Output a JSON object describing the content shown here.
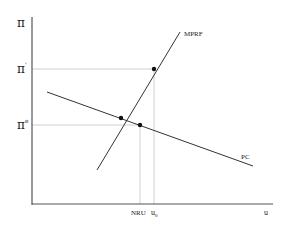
{
  "diagram": {
    "title": "",
    "axes": {
      "y_label": "π",
      "x_label": "u"
    },
    "y_ticks": [
      {
        "label": "π",
        "sup": "'",
        "name": "pi-prime"
      },
      {
        "label": "π",
        "sup": "e",
        "name": "pi-e"
      }
    ],
    "x_ticks": [
      {
        "label": "NRU",
        "name": "nru"
      },
      {
        "label": "u",
        "sub": "0",
        "name": "u0"
      }
    ],
    "curves": [
      {
        "name": "MPRF",
        "label": "MPRF"
      },
      {
        "name": "PC",
        "label": "PC"
      }
    ],
    "points": [
      {
        "name": "mprf-pc-intersection"
      },
      {
        "name": "pc-at-nru"
      },
      {
        "name": "mprf-at-u0"
      }
    ],
    "colors": {
      "axis": "#444444",
      "curve": "#333333",
      "guide": "#cfcfcf",
      "point": "#111111"
    }
  }
}
